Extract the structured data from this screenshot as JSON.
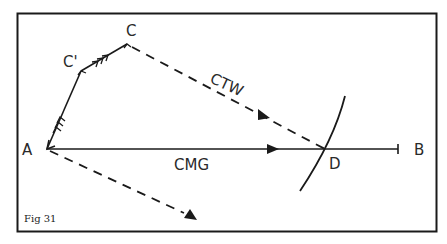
{
  "figure": {
    "caption": "Fig 31",
    "points": {
      "A": "A",
      "B": "B",
      "C": "C",
      "C_prime": "C'",
      "D": "D"
    },
    "vectors": {
      "ctw": "CTW",
      "cmg": "CMG"
    },
    "colors": {
      "ink": "#1a1a1a",
      "background": "#ffffff"
    }
  }
}
